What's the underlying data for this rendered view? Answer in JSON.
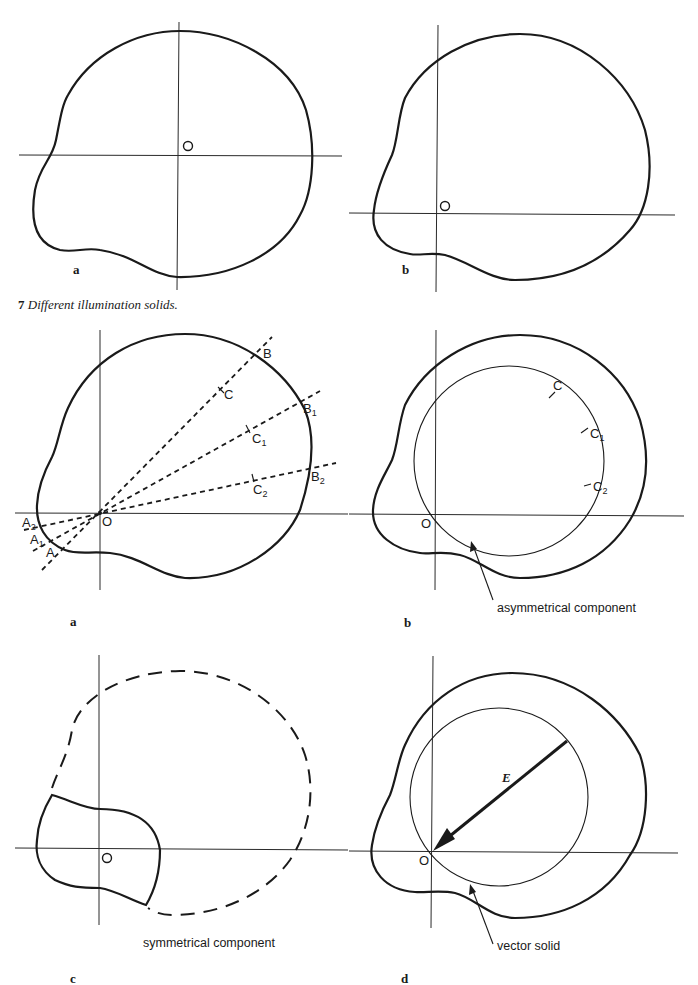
{
  "figure7": {
    "caption_number": "7",
    "caption_text": "Different illumination solids.",
    "panels": [
      {
        "label": "a",
        "origin_label": "O"
      },
      {
        "label": "b",
        "origin_label": "O"
      }
    ]
  },
  "figure8": {
    "panels": [
      {
        "label": "a",
        "origin_label": "O",
        "points": {
          "B": "B",
          "B1_main": "B",
          "B1_sub": "1",
          "B2_main": "B",
          "B2_sub": "2",
          "C": "C",
          "C1_main": "C",
          "C1_sub": "1",
          "C2_main": "C",
          "C2_sub": "2",
          "A": "A",
          "A1_main": "A",
          "A1_sub": "1",
          "A2_main": "A",
          "A2_sub": "2"
        }
      },
      {
        "label": "b",
        "origin_label": "O",
        "points": {
          "C": "C",
          "C1_main": "C",
          "C1_sub": "1",
          "C2_main": "C",
          "C2_sub": "2"
        },
        "annotation": "asymmetrical component"
      },
      {
        "label": "c",
        "origin_label": "O",
        "annotation": "symmetrical component"
      },
      {
        "label": "d",
        "origin_label": "O",
        "vector_label": "E",
        "annotation": "vector solid"
      }
    ]
  },
  "colors": {
    "ink": "#1a1a1a",
    "paper": "#ffffff"
  }
}
